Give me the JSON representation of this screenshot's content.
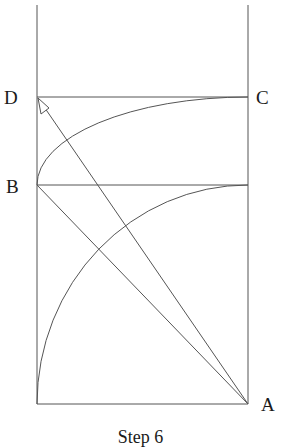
{
  "diagram": {
    "caption": "Step 6",
    "stroke_color": "#555555",
    "points": {
      "A": {
        "label": "A",
        "x": 248,
        "y": 404
      },
      "B": {
        "label": "B",
        "x": 37,
        "y": 185
      },
      "C": {
        "label": "C",
        "x": 248,
        "y": 97
      },
      "D": {
        "label": "D",
        "x": 37,
        "y": 97
      }
    },
    "frame": {
      "left_x": 37,
      "right_x": 248,
      "top_y": 5,
      "bottom_y": 404
    },
    "horizontals": [
      {
        "name": "line-dc",
        "y": 97
      },
      {
        "name": "line-b",
        "y": 185
      },
      {
        "name": "line-bottom",
        "y": 404
      }
    ],
    "diagonals": [
      {
        "name": "diagonal-ab",
        "from": "A",
        "to": "B"
      },
      {
        "name": "diagonal-ad",
        "from": "A",
        "to": "D",
        "arrow": true
      }
    ],
    "arcs": [
      {
        "name": "arc-lower",
        "from": [
          37,
          404
        ],
        "to": [
          248,
          185
        ]
      },
      {
        "name": "arc-upper",
        "from": [
          37,
          185
        ],
        "to": [
          248,
          97
        ]
      }
    ]
  }
}
